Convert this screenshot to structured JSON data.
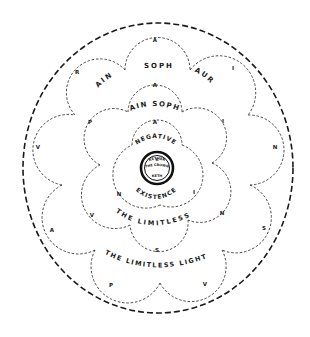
{
  "diagram": {
    "outer_ring": {
      "shape": "dashed-circle",
      "color": "#1a1a1a"
    },
    "outer_veil": {
      "label_words": [
        "AIN",
        "SOPH",
        "AUR"
      ],
      "letters": [
        "A",
        "I",
        "N",
        "S",
        "V",
        "P",
        "A",
        "V",
        "R"
      ]
    },
    "middle_veil": {
      "label_words": [
        "AIN SOPH",
        "THE LIMITLESS LIGHT"
      ],
      "letters": [
        "A",
        "I",
        "N",
        "S",
        "V",
        "P"
      ]
    },
    "inner_veil": {
      "label_words": [
        "NEGATIVE",
        "EXISTENCE",
        "THE LIMITLESS"
      ],
      "letters": [
        "A",
        "I",
        "N"
      ]
    },
    "center": {
      "line1": "K",
      "line2": "KETHER",
      "line3": "THE CROWN",
      "line4": "KETH"
    },
    "outer_letters": {
      "top": "A",
      "r": "R",
      "i": "I",
      "v_left": "V",
      "n_right": "N",
      "a_left": "A",
      "s_right": "S",
      "p_bottom": "P",
      "v_bottom": "V"
    },
    "middle_letters": {
      "top": "A",
      "p": "P",
      "i": "I",
      "v": "V",
      "n": "N",
      "s": "S"
    },
    "inner_letters": {
      "top": "A",
      "n": "N",
      "i": "I"
    },
    "texts": {
      "ain": "AIN",
      "soph": "SOPH",
      "aur": "AUR",
      "ain_soph": "AIN SOPH",
      "negative": "NEGATIVE",
      "existence": "EXISTENCE",
      "the_limitless": "THE LIMITLESS",
      "the_limitless_light": "THE LIMITLESS LIGHT"
    }
  }
}
